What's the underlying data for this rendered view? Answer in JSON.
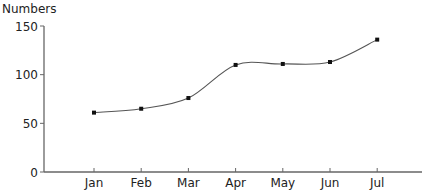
{
  "chart_data": {
    "type": "line",
    "title": "",
    "xlabel": "",
    "ylabel": "Numbers",
    "categories": [
      "Jan",
      "Feb",
      "Mar",
      "Apr",
      "May",
      "Jun",
      "Jul"
    ],
    "series": [
      {
        "name": "Numbers",
        "values": [
          61,
          65,
          76,
          110,
          111,
          113,
          136
        ]
      }
    ],
    "ylim": [
      0,
      150
    ],
    "yticks": [
      0,
      50,
      100,
      150
    ],
    "grid": false,
    "legend": "none",
    "smooth": true,
    "markers": true,
    "line_color": "#555555",
    "marker_color": "#111111"
  }
}
